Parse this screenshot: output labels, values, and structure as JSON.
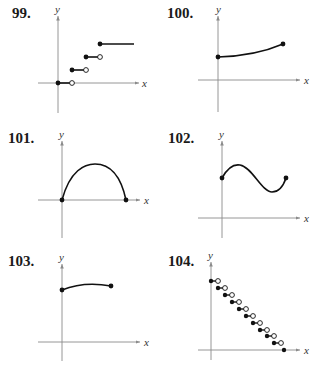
{
  "problems": [
    {
      "number": "99.",
      "graph": "step-function-increasing"
    },
    {
      "number": "100.",
      "graph": "increasing-curve-closed-endpoints"
    },
    {
      "number": "101.",
      "graph": "arch-curve-closed-endpoints"
    },
    {
      "number": "102.",
      "graph": "wave-curve-closed-endpoints"
    },
    {
      "number": "103.",
      "graph": "slightly-concave-curve-closed-endpoints"
    },
    {
      "number": "104.",
      "graph": "step-function-decreasing"
    }
  ],
  "axis_labels": {
    "x": "x",
    "y": "y"
  },
  "colors": {
    "ink": "#111111",
    "axis": "#8a8a8a",
    "open_fill": "#ffffff"
  }
}
